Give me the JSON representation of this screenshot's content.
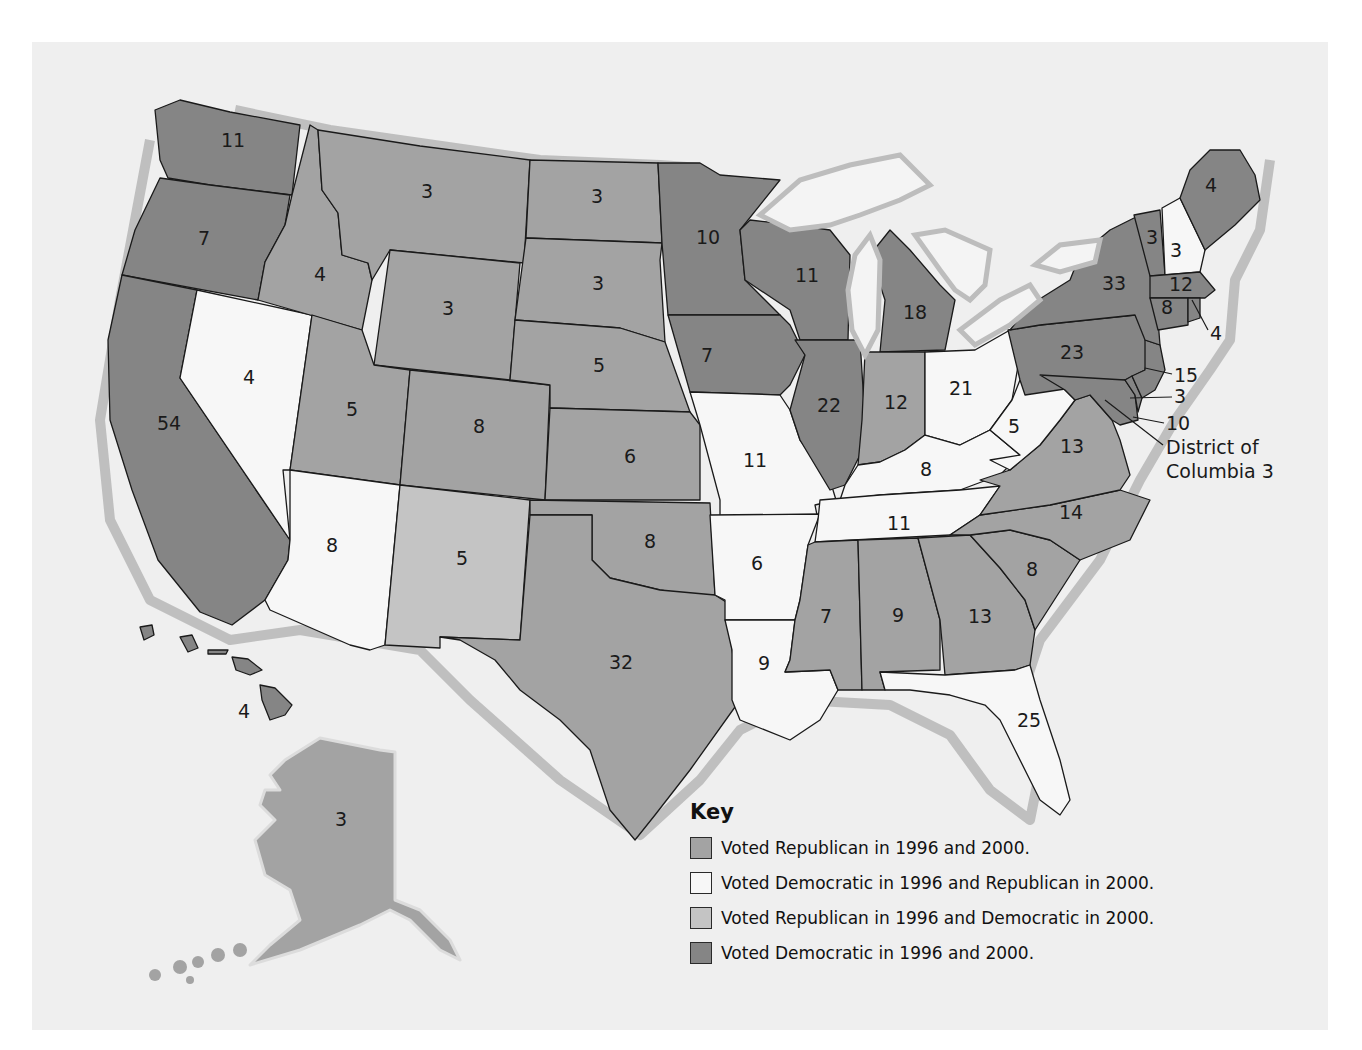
{
  "colors": {
    "rep_both": "#a3a3a3",
    "dem_then_rep": "#f7f7f7",
    "rep_then_dem": "#c4c4c4",
    "dem_both": "#858585",
    "background": "#efefef"
  },
  "key": {
    "title": "Key",
    "items": [
      {
        "category": "rep_both",
        "label": "Voted Republican in 1996 and 2000."
      },
      {
        "category": "dem_then_rep",
        "label": "Voted Democratic in 1996 and Republican in 2000."
      },
      {
        "category": "rep_then_dem",
        "label": "Voted Republican in 1996 and Democratic in 2000."
      },
      {
        "category": "dem_both",
        "label": "Voted Democratic in 1996 and 2000."
      }
    ]
  },
  "states": [
    {
      "id": "WA",
      "votes": "11",
      "category": "dem_both"
    },
    {
      "id": "OR",
      "votes": "7",
      "category": "dem_both"
    },
    {
      "id": "CA",
      "votes": "54",
      "category": "dem_both"
    },
    {
      "id": "NV",
      "votes": "4",
      "category": "dem_then_rep"
    },
    {
      "id": "ID",
      "votes": "4",
      "category": "rep_both"
    },
    {
      "id": "MT",
      "votes": "3",
      "category": "rep_both"
    },
    {
      "id": "WY",
      "votes": "3",
      "category": "rep_both"
    },
    {
      "id": "UT",
      "votes": "5",
      "category": "rep_both"
    },
    {
      "id": "CO",
      "votes": "8",
      "category": "rep_both"
    },
    {
      "id": "AZ",
      "votes": "8",
      "category": "dem_then_rep"
    },
    {
      "id": "NM",
      "votes": "5",
      "category": "rep_then_dem"
    },
    {
      "id": "ND",
      "votes": "3",
      "category": "rep_both"
    },
    {
      "id": "SD",
      "votes": "3",
      "category": "rep_both"
    },
    {
      "id": "NE",
      "votes": "5",
      "category": "rep_both"
    },
    {
      "id": "KS",
      "votes": "6",
      "category": "rep_both"
    },
    {
      "id": "OK",
      "votes": "8",
      "category": "rep_both"
    },
    {
      "id": "TX",
      "votes": "32",
      "category": "rep_both"
    },
    {
      "id": "MN",
      "votes": "10",
      "category": "dem_both"
    },
    {
      "id": "IA",
      "votes": "7",
      "category": "dem_both"
    },
    {
      "id": "MO",
      "votes": "11",
      "category": "dem_then_rep"
    },
    {
      "id": "AR",
      "votes": "6",
      "category": "dem_then_rep"
    },
    {
      "id": "LA",
      "votes": "9",
      "category": "dem_then_rep"
    },
    {
      "id": "WI",
      "votes": "11",
      "category": "dem_both"
    },
    {
      "id": "IL",
      "votes": "22",
      "category": "dem_both"
    },
    {
      "id": "MI",
      "votes": "18",
      "category": "dem_both"
    },
    {
      "id": "IN",
      "votes": "12",
      "category": "rep_both"
    },
    {
      "id": "OH",
      "votes": "21",
      "category": "dem_then_rep"
    },
    {
      "id": "KY",
      "votes": "8",
      "category": "dem_then_rep"
    },
    {
      "id": "TN",
      "votes": "11",
      "category": "dem_then_rep"
    },
    {
      "id": "MS",
      "votes": "7",
      "category": "rep_both"
    },
    {
      "id": "AL",
      "votes": "9",
      "category": "rep_both"
    },
    {
      "id": "GA",
      "votes": "13",
      "category": "rep_both"
    },
    {
      "id": "FL",
      "votes": "25",
      "category": "dem_then_rep"
    },
    {
      "id": "SC",
      "votes": "8",
      "category": "rep_both"
    },
    {
      "id": "NC",
      "votes": "14",
      "category": "rep_both"
    },
    {
      "id": "VA",
      "votes": "13",
      "category": "rep_both"
    },
    {
      "id": "WV",
      "votes": "5",
      "category": "dem_then_rep"
    },
    {
      "id": "PA",
      "votes": "23",
      "category": "dem_both"
    },
    {
      "id": "NY",
      "votes": "33",
      "category": "dem_both"
    },
    {
      "id": "VT",
      "votes": "3",
      "category": "dem_both"
    },
    {
      "id": "NH",
      "votes": "3",
      "category": "dem_then_rep"
    },
    {
      "id": "ME",
      "votes": "4",
      "category": "dem_both"
    },
    {
      "id": "MA",
      "votes": "12",
      "category": "dem_both"
    },
    {
      "id": "CT",
      "votes": "8",
      "category": "dem_both"
    },
    {
      "id": "RI",
      "votes": "4",
      "category": "dem_both"
    },
    {
      "id": "NJ",
      "votes": "15",
      "category": "dem_both"
    },
    {
      "id": "DE",
      "votes": "3",
      "category": "dem_both"
    },
    {
      "id": "MD",
      "votes": "10",
      "category": "dem_both"
    },
    {
      "id": "AK",
      "votes": "3",
      "category": "rep_both"
    },
    {
      "id": "HI",
      "votes": "4",
      "category": "dem_both"
    }
  ],
  "callouts": {
    "dc_line1": "District of",
    "dc_line2": "Columbia 3"
  }
}
